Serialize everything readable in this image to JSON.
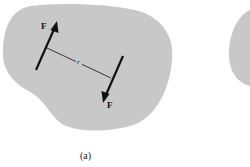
{
  "figure": {
    "caption": "(a)",
    "force_label_top": "F",
    "force_label_bottom": "F",
    "distance_label": "r",
    "colors": {
      "body_fill": "#c8c8c8",
      "stroke": "#111111",
      "background": "#ffffff"
    }
  }
}
